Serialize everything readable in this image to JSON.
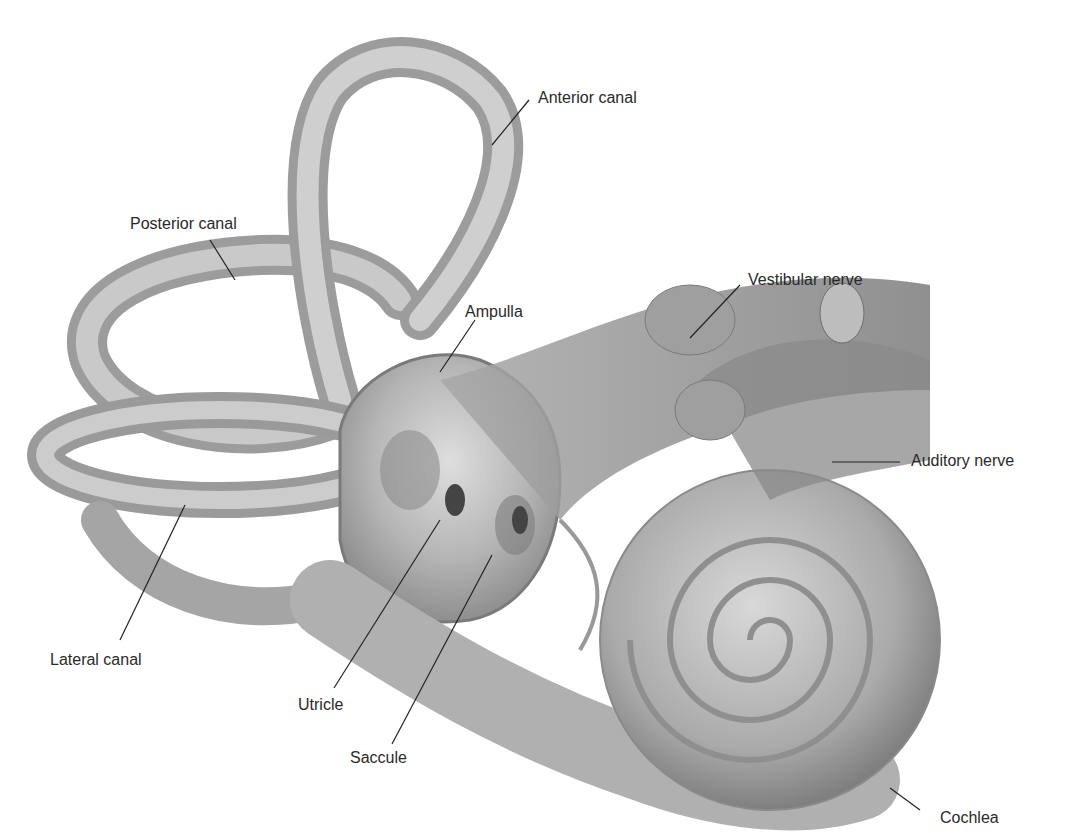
{
  "figure": {
    "labels": {
      "anterior_canal": "Anterior canal",
      "posterior_canal": "Posterior canal",
      "vestibular_nerve": "Vestibular nerve",
      "ampulla": "Ampulla",
      "auditory_nerve": "Auditory nerve",
      "lateral_canal": "Lateral canal",
      "utricle": "Utricle",
      "saccule": "Saccule",
      "cochlea": "Cochlea"
    },
    "colors": {
      "structure_fill": "#b8b8b8",
      "structure_dark": "#8a8a8a",
      "structure_light": "#d6d6d6",
      "nerve": "#9a9a9a",
      "leader_line": "#222222",
      "text": "#2a2a2a"
    }
  }
}
